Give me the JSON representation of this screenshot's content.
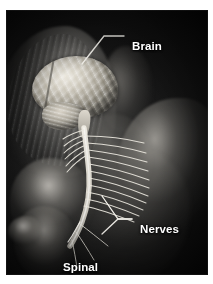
{
  "figure": {
    "frame_color": "#ffffff",
    "background_color": "#0a0a0a",
    "anatomy_color": "#e8e4da",
    "label_color": "#ffffff",
    "leader_line_color": "#f2f0ea"
  },
  "labels": [
    {
      "id": "brain",
      "text": "Brain",
      "position": "upper-right",
      "points_to": "cerebrum"
    },
    {
      "id": "nerves",
      "text": "Nerves",
      "position": "lower-right",
      "points_to": "spinal-nerve-roots"
    },
    {
      "id": "spinal_cord",
      "line1": "Spinal",
      "line2": "cord",
      "text": "Spinal cord",
      "position": "lower-left",
      "points_to": "spinal-cord"
    }
  ],
  "structures": {
    "brain": "cerebrum with gyri and sulci, cerebellum, brain stem",
    "spinal_cord": "descending cord from brain stem through cervical and thoracic spine",
    "nerves": "paired spinal nerve roots fanning laterally across the back"
  }
}
